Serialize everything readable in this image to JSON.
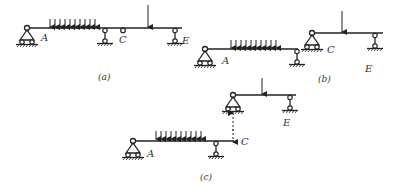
{
  "figure": {
    "panels": [
      {
        "id": "a",
        "caption": "(a)",
        "labels": {
          "A": "A",
          "C": "C",
          "E": "E"
        }
      },
      {
        "id": "b",
        "caption": "(b)",
        "labels": {
          "A": "A",
          "C": "C",
          "E": "E"
        }
      },
      {
        "id": "c",
        "caption": "(c)",
        "labels": {
          "A": "A",
          "C": "C",
          "E": "E"
        }
      }
    ]
  },
  "colors": {
    "line": "#222222",
    "text": "#333333",
    "background": "#ffffff"
  }
}
